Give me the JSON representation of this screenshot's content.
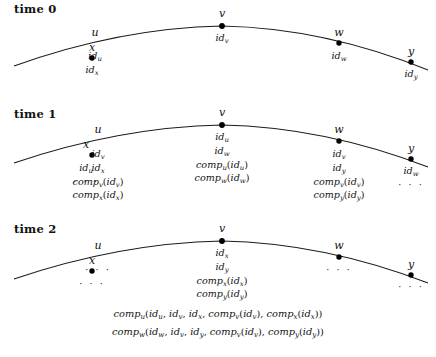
{
  "figure": {
    "title": "",
    "type": "diagram"
  },
  "panels": [
    {
      "id": "time-0",
      "time_label": "time 0",
      "nodes": [
        {
          "name": "x",
          "x": 92,
          "y": 58,
          "labels": [
            "id_x"
          ]
        },
        {
          "name": "u",
          "x": 95,
          "y": 43,
          "labels": [
            "id_u"
          ]
        },
        {
          "name": "v",
          "x": 222,
          "y": 25,
          "labels": [
            "id_v"
          ]
        },
        {
          "name": "w",
          "x": 339,
          "y": 43,
          "labels": [
            "id_w"
          ]
        },
        {
          "name": "y",
          "x": 411,
          "y": 62,
          "labels": [
            "id_y"
          ]
        }
      ]
    },
    {
      "id": "time-1",
      "time_label": "time 1",
      "nodes": [
        {
          "name": "x",
          "labels": [
            "id_u",
            "..."
          ]
        },
        {
          "name": "u",
          "labels": [
            "id_v",
            "id_x",
            "comp_v(id_v)",
            "comp_x(id_x)"
          ]
        },
        {
          "name": "v",
          "labels": [
            "id_u",
            "id_w",
            "comp_u(id_u)",
            "comp_w(id_w)"
          ]
        },
        {
          "name": "w",
          "labels": [
            "id_v",
            "id_y",
            "comp_v(id_v)",
            "comp_y(id_y)"
          ]
        },
        {
          "name": "y",
          "labels": [
            "id_w",
            "..."
          ]
        }
      ]
    },
    {
      "id": "time-2",
      "time_label": "time 2",
      "nodes": [
        {
          "name": "x",
          "labels": [
            "..."
          ]
        },
        {
          "name": "u",
          "labels": [
            "..."
          ]
        },
        {
          "name": "v",
          "labels": [
            "id_x",
            "id_y",
            "comp_x(id_x)",
            "comp_y(id_y)"
          ]
        },
        {
          "name": "w",
          "labels": [
            "..."
          ]
        },
        {
          "name": "y",
          "labels": [
            "..."
          ]
        }
      ],
      "wide_rows": [
        "comp_u(id_u, id_v, id_x, comp_v(id_v), comp_x(id_x))",
        "comp_w(id_w, id_v, id_y, comp_v(id_v), comp_y(id_y))"
      ]
    }
  ],
  "style": {
    "curve_color": "#1a1a1a",
    "node_color": "#000000",
    "text_color": "#111111",
    "background": "#ffffff"
  }
}
